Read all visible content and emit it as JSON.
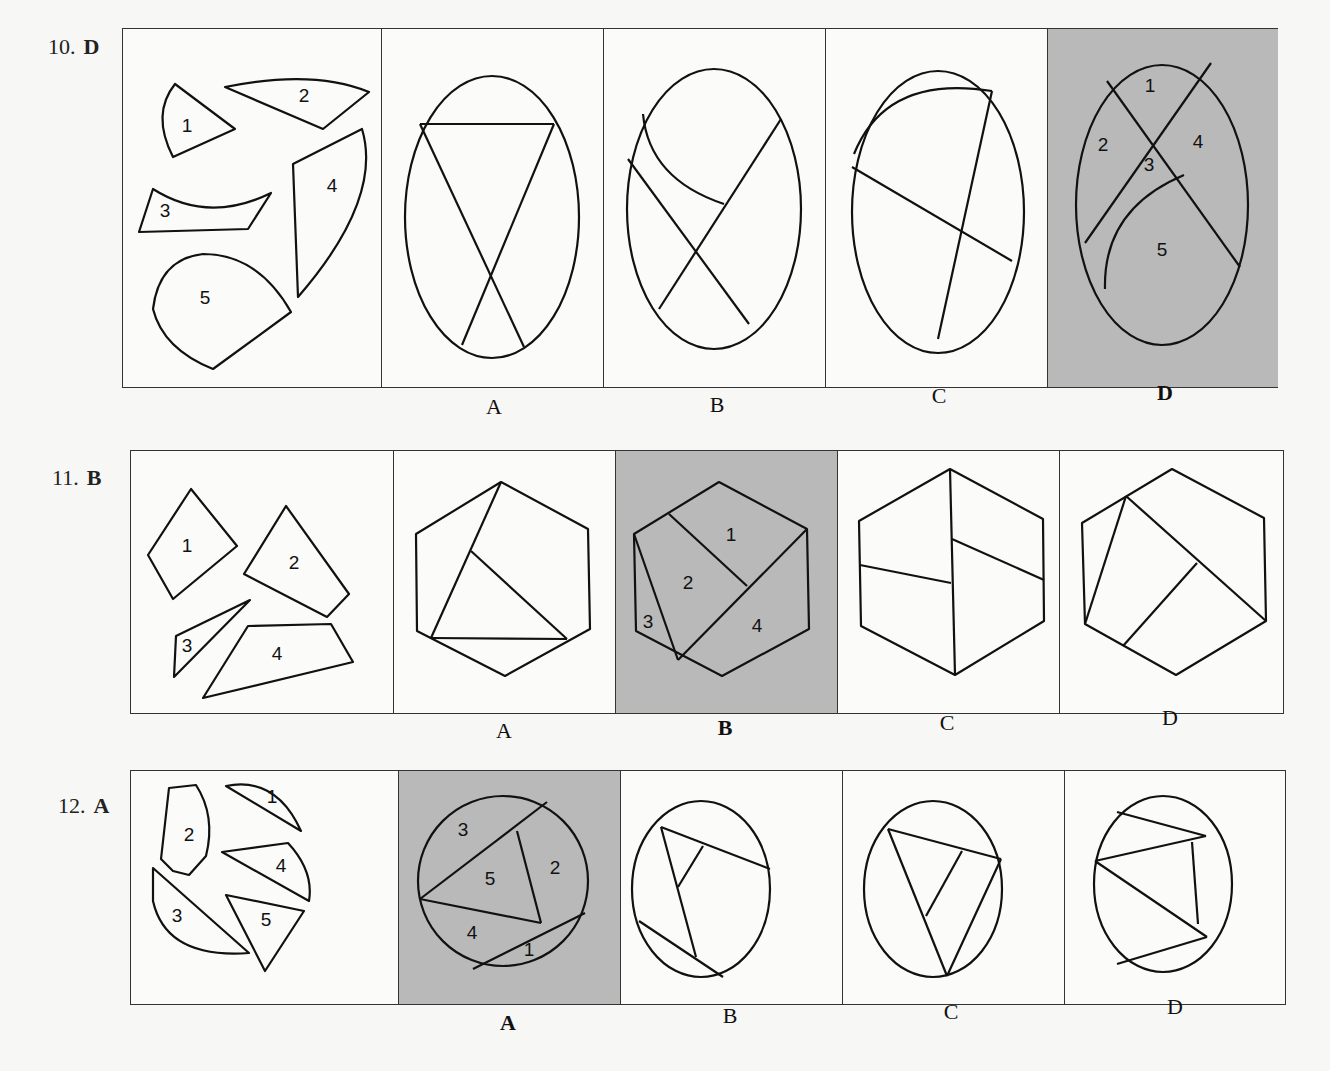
{
  "questions": [
    {
      "number": "10.",
      "answer": "D",
      "pieces_labels": [
        "1",
        "2",
        "3",
        "4",
        "5"
      ],
      "options": [
        "A",
        "B",
        "C",
        "D"
      ],
      "selected": "D",
      "selected_region_labels": [
        "1",
        "2",
        "3",
        "4",
        "5"
      ],
      "shape": "ellipse"
    },
    {
      "number": "11.",
      "answer": "B",
      "pieces_labels": [
        "1",
        "2",
        "3",
        "4"
      ],
      "options": [
        "A",
        "B",
        "C",
        "D"
      ],
      "selected": "B",
      "selected_region_labels": [
        "1",
        "2",
        "3",
        "4"
      ],
      "shape": "hexagon"
    },
    {
      "number": "12.",
      "answer": "A",
      "pieces_labels": [
        "1",
        "2",
        "3",
        "4",
        "5"
      ],
      "options": [
        "A",
        "B",
        "C",
        "D"
      ],
      "selected": "A",
      "selected_region_labels": [
        "3",
        "5",
        "2",
        "4",
        "1"
      ],
      "shape": "circle"
    }
  ],
  "colors": {
    "selected_bg": "#b9b9b9",
    "line": "#111111",
    "page_bg": "#f7f7f5"
  }
}
